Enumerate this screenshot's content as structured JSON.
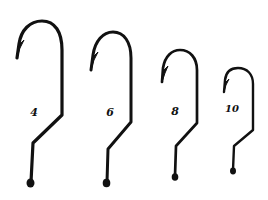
{
  "diagram": {
    "background": "#ffffff",
    "ink": "#111111",
    "hooks": [
      {
        "size_label": "4",
        "stroke": 3.2,
        "label_pos": [
          34,
          112
        ],
        "label_font": 11,
        "path": "M 17 58 L 19 44 C 21 30, 30 21, 42 21 C 55 21, 62 32, 62 50 L 62 115 L 33 143 L 31 182",
        "barb": "M 17 58 L 18 46 L 24 40 L 20 48 Z",
        "eye": [
          30.5,
          183,
          4
        ]
      },
      {
        "size_label": "6",
        "stroke": 3.0,
        "label_pos": [
          110,
          112
        ],
        "label_font": 11,
        "path": "M 91 70 L 93 55 C 95 41, 103 32, 113 32 C 124 32, 131 42, 131 58 L 131 122 L 108 149 L 107 182",
        "barb": "M 91 70 L 92 58 L 98 52 L 94 60 Z",
        "eye": [
          106.5,
          183,
          3.8
        ]
      },
      {
        "size_label": "8",
        "stroke": 2.7,
        "label_pos": [
          175,
          111
        ],
        "label_font": 11,
        "path": "M 162 82 L 163 68 C 165 56, 172 50, 180 50 C 190 50, 197 58, 197 70 L 197 123 L 176 146 L 175 176",
        "barb": "M 162 82 L 163 71 L 168 66 L 165 73 Z",
        "eye": [
          175,
          177,
          3.3
        ]
      },
      {
        "size_label": "10",
        "stroke": 2.4,
        "label_pos": [
          232,
          109
        ],
        "label_font": 10,
        "path": "M 224 92 L 225 80 C 226 72, 231 68, 238 68 C 247 68, 253 74, 253 84 L 253 130 L 234 146 L 233 170",
        "barb": "M 224 92 L 225 83 L 229 79 L 226 85 Z",
        "eye": [
          233,
          171,
          3
        ]
      }
    ]
  }
}
